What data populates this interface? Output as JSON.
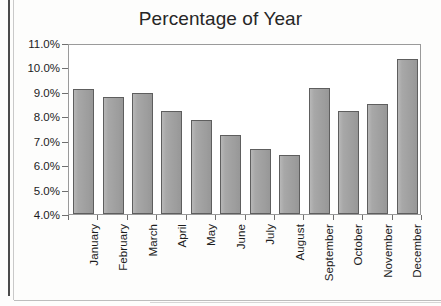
{
  "chart_data": {
    "type": "bar",
    "title": "Percentage of Year",
    "xlabel": "",
    "ylabel": "",
    "ylim": [
      4.0,
      11.0
    ],
    "ytick_step": 1.0,
    "grid": false,
    "legend": null,
    "y_unit": "%",
    "categories": [
      "January",
      "February",
      "March",
      "April",
      "May",
      "June",
      "July",
      "August",
      "September",
      "October",
      "November",
      "December"
    ],
    "ytick_labels": [
      "11.0%",
      "10.0%",
      "9.0%",
      "8.0%",
      "7.0%",
      "6.0%",
      "5.0%",
      "4.0%"
    ],
    "ytick_values": [
      11.0,
      10.0,
      9.0,
      8.0,
      7.0,
      6.0,
      5.0,
      4.0
    ],
    "values": [
      9.1,
      8.8,
      8.95,
      8.2,
      7.85,
      7.25,
      6.65,
      6.4,
      9.15,
      8.2,
      8.5,
      10.35
    ],
    "series": [
      {
        "name": "Percentage of Year",
        "values": [
          9.1,
          8.8,
          8.95,
          8.2,
          7.85,
          7.25,
          6.65,
          6.4,
          9.15,
          8.2,
          8.5,
          10.35
        ]
      }
    ],
    "label_rotation": -90
  },
  "style": {
    "bar_fill": "#a3a3a3",
    "bar_border": "#5e5e5e",
    "axis_color": "#6f6f6f",
    "frame_color": "#9a9a9a",
    "text_color": "#1c1c1c",
    "title_color": "#262626",
    "background": "#ffffff"
  }
}
